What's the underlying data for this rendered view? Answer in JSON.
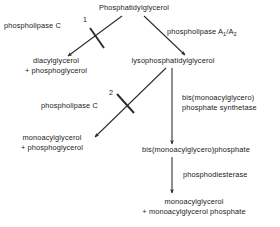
{
  "diagram": {
    "colors": {
      "stroke": "#2b2b2b",
      "background": "#ffffff",
      "text": "#1a1a1a"
    },
    "nodes": [
      {
        "id": "phosphatidylglycerol",
        "label": "Phosphatidylglycerol"
      },
      {
        "id": "diacylglycerol",
        "line1": "diacylglycerol",
        "line2": "+ phosphoglycerol"
      },
      {
        "id": "lysophosphatidylglycerol",
        "label": "lysophosphatidylglycerol"
      },
      {
        "id": "monoacylglycerol-phosphoglycerol",
        "line1": "monoacylglycerol",
        "line2": "+ phosphoglycerol"
      },
      {
        "id": "bis-monoacylglycerophosphate",
        "label": "bis(monoacylglycero)phosphate"
      },
      {
        "id": "monoacylglycerol-monoacylglycerol-phosphate",
        "line1": "monoacylglycerol",
        "line2": "+ monoacylglycerol phosphate"
      }
    ],
    "enzymes": [
      {
        "id": "phospholipase-c-1",
        "label": "phospholipase C",
        "marker": "1"
      },
      {
        "id": "phospholipase-a1-a2",
        "label_prefix": "phospholipase A",
        "sub1": "1",
        "separator": "/A",
        "sub2": "2"
      },
      {
        "id": "phospholipase-c-2",
        "label": "phospholipase C",
        "marker": "2"
      },
      {
        "id": "bis-monoacylglycero-phosphate-synthetase",
        "line1": "bis(monoacylglycero)",
        "line2": "phosphate synthetase"
      },
      {
        "id": "phosphodiesterase",
        "label": "phosphodiesterase"
      }
    ]
  }
}
